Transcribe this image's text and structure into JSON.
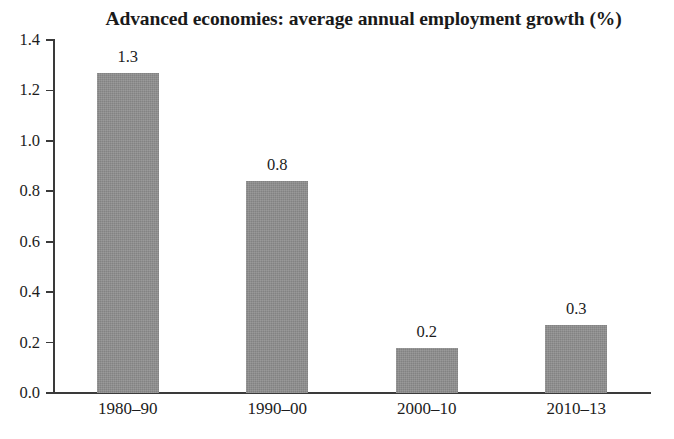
{
  "chart_data": {
    "type": "bar",
    "title": "Advanced economies: average annual employment growth (%)",
    "xlabel": "",
    "ylabel": "",
    "categories": [
      "1980–90",
      "1990–00",
      "2000–10",
      "2010–13"
    ],
    "values": [
      1.3,
      0.8,
      0.2,
      0.3
    ],
    "bar_pixel_values": [
      1.27,
      0.84,
      0.18,
      0.27
    ],
    "data_labels": [
      "1.3",
      "0.8",
      "0.2",
      "0.3"
    ],
    "ylim": [
      0.0,
      1.4
    ],
    "ytick_labels": [
      "0.0",
      "0.2",
      "0.4",
      "0.6",
      "0.8",
      "1.0",
      "1.2",
      "1.4"
    ],
    "ytick_values": [
      0.0,
      0.2,
      0.4,
      0.6,
      0.8,
      1.0,
      1.2,
      1.4
    ],
    "grid": false,
    "legend": "none",
    "bar_color": "#8e8e8e",
    "axis_color": "#3a3a3a",
    "text_color": "#1c1c1c",
    "background_color": "#ffffff"
  }
}
